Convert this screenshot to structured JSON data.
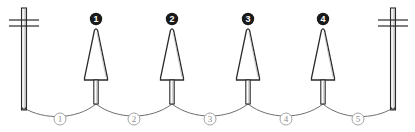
{
  "diagram": {
    "background_color": "#ffffff",
    "stroke_color": "#2b2b2b",
    "wire_color": "#6f6f6f",
    "pole_fill": "#f2f2f2",
    "marker_fill": "#1a1a1a",
    "marker_text_color": "#ffffff",
    "span_label_color": "#8d8d8d",
    "span_circle_color": "#9a9a9a",
    "terminal_poles": [
      {
        "name": "left-pole",
        "x": 24,
        "top": 8,
        "bottom": 110,
        "crossarms": [
          20,
          26
        ]
      },
      {
        "name": "right-pole",
        "x": 393,
        "top": 8,
        "bottom": 110,
        "crossarms": [
          20,
          26
        ]
      }
    ],
    "insulators": [
      {
        "label": "1",
        "x": 96
      },
      {
        "label": "2",
        "x": 172
      },
      {
        "label": "3",
        "x": 248
      },
      {
        "label": "4",
        "x": 323
      }
    ],
    "spans": [
      {
        "label": "1",
        "x": 60,
        "from": "left-pole",
        "to": "1"
      },
      {
        "label": "2",
        "x": 134,
        "from": "1",
        "to": "2"
      },
      {
        "label": "3",
        "x": 210,
        "from": "2",
        "to": "3"
      },
      {
        "label": "4",
        "x": 286,
        "from": "3",
        "to": "4"
      },
      {
        "label": "5",
        "x": 358,
        "from": "4",
        "to": "right-pole"
      }
    ]
  }
}
